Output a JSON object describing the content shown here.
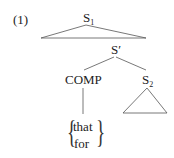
{
  "example_number": "(1)",
  "tree": {
    "root": {
      "label": "S",
      "subscript": "1"
    },
    "sbar": {
      "label": "S′"
    },
    "comp": {
      "label": "COMP"
    },
    "s2": {
      "label": "S",
      "subscript": "2"
    },
    "comp_options": [
      "that",
      "for"
    ]
  },
  "colors": {
    "line": "#555555",
    "text": "#222222"
  }
}
